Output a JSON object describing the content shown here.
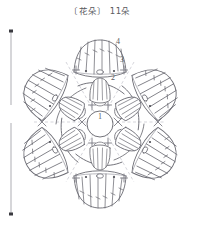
{
  "title": {
    "bracket_open": "〔",
    "label": "花朵",
    "bracket_close": "〕",
    "count": "11朵",
    "full": "〔花朵〕 11朵"
  },
  "dimension": {
    "value": "7",
    "orientation": "vertical",
    "position": "left"
  },
  "round_labels": [
    {
      "id": "round-1",
      "text": "1",
      "x": 100,
      "y": 119
    },
    {
      "id": "round-2",
      "text": "2",
      "x": 113,
      "y": 80
    },
    {
      "id": "round-3",
      "text": "3",
      "x": 122,
      "y": 62
    },
    {
      "id": "round-4",
      "text": "4",
      "x": 118,
      "y": 44
    }
  ],
  "colors": {
    "background": "#ffffff",
    "stroke": "#6b6b73",
    "stroke_light": "#9a9aa2",
    "guide": "#b8b8c0",
    "text": "#5a5a60"
  },
  "chart_data": {
    "type": "diagram",
    "title": "〔花朵〕 11朵",
    "symmetry": 6,
    "rounds": [
      {
        "number": 1,
        "name": "center ring",
        "element": "magic ring with chain loops"
      },
      {
        "number": 2,
        "name": "inner petals",
        "element": "small shell petals"
      },
      {
        "number": 3,
        "name": "connecting arcs",
        "element": "chain arcs between petals"
      },
      {
        "number": 4,
        "name": "outer petals",
        "element": "large fan shells"
      }
    ],
    "dimension_label": "7",
    "motif_count": "11朵"
  }
}
